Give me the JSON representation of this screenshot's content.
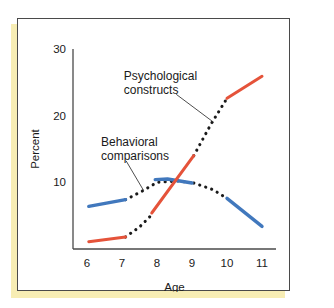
{
  "figure": {
    "frame_border_color": "#4a4a4a",
    "shadow_color": "#f7edb4",
    "background_color": "#ffffff"
  },
  "chart_data": {
    "type": "line",
    "title": "",
    "xlabel": "Age",
    "ylabel": "Percent",
    "xlim": [
      5.6,
      11.4
    ],
    "ylim": [
      0,
      30
    ],
    "xticks": [
      6,
      7,
      8,
      9,
      10,
      11
    ],
    "xtick_labels": [
      "6",
      "7",
      "8",
      "9",
      "10",
      "11"
    ],
    "yticks": [
      10,
      20,
      30
    ],
    "ytick_labels": [
      "10",
      "20",
      "30"
    ],
    "grid": false,
    "legend": "none",
    "series": [
      {
        "name": "Behavioral comparisons",
        "style": "solid",
        "color": "#4178bd",
        "segments": [
          {
            "x": [
              6.05,
              7.1
            ],
            "y": [
              6.4,
              7.4
            ]
          },
          {
            "x": [
              7.95,
              8.3,
              9.0
            ],
            "y": [
              10.4,
              10.5,
              9.9
            ]
          },
          {
            "x": [
              10.0,
              11.0
            ],
            "y": [
              7.6,
              3.4
            ]
          }
        ]
      },
      {
        "name": "Psychological constructs",
        "style": "solid",
        "color": "#e5533a",
        "segments": [
          {
            "x": [
              6.05,
              7.1
            ],
            "y": [
              1.1,
              1.8
            ]
          },
          {
            "x": [
              7.85,
              9.05
            ],
            "y": [
              5.4,
              14.0
            ]
          },
          {
            "x": [
              10.0,
              11.0
            ],
            "y": [
              22.6,
              25.9
            ]
          }
        ]
      },
      {
        "name": "Connecting trend (dotted)",
        "style": "dotted",
        "color": "#1a1a1a",
        "segments": [
          {
            "x": [
              7.1,
              7.55,
              8.0,
              8.6,
              9.05
            ],
            "y": [
              7.4,
              8.6,
              10.0,
              10.2,
              9.9
            ]
          },
          {
            "x": [
              9.05,
              9.6,
              10.0
            ],
            "y": [
              9.9,
              8.9,
              7.6
            ]
          },
          {
            "x": [
              7.1,
              7.5,
              7.9
            ],
            "y": [
              1.8,
              3.3,
              5.4
            ]
          },
          {
            "x": [
              9.05,
              9.55,
              10.0
            ],
            "y": [
              14.0,
              18.8,
              22.6
            ]
          }
        ]
      }
    ],
    "annotations": [
      {
        "label_line1": "Psychological",
        "label_line2": "constructs",
        "text_x": 7.05,
        "text_y": 25.3,
        "leader_from_x": 8.55,
        "leader_from_y": 23.2,
        "leader_to_x": 9.62,
        "leader_to_y": 19.0
      },
      {
        "label_line1": "Behavioral",
        "label_line2": "comparisons",
        "text_x": 6.4,
        "text_y": 15.4,
        "leader_from_x": 7.12,
        "leader_from_y": 13.2,
        "leader_to_x": 7.62,
        "leader_to_y": 8.75
      }
    ]
  }
}
